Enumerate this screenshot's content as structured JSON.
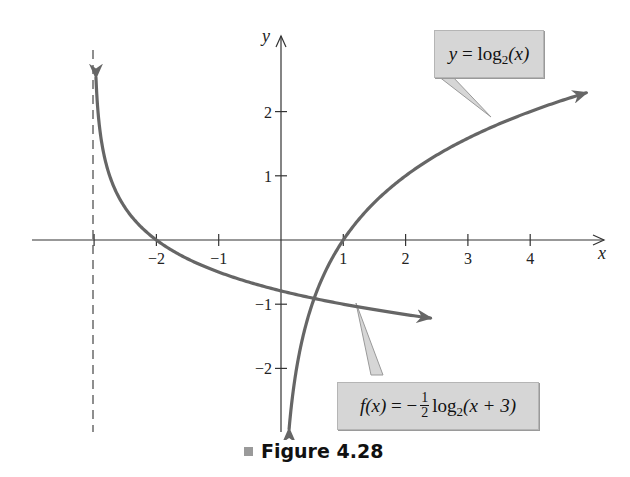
{
  "figure": {
    "caption": "Figure 4.28"
  },
  "labels": {
    "x_axis": "x",
    "y_axis": "y",
    "callout_log2": {
      "lhs": "y",
      "eq": " = log",
      "base": "2",
      "arg": "(x)"
    },
    "callout_f": {
      "lhs": "f(x)",
      "eq": " = −",
      "frac_num": "1",
      "frac_den": "2",
      "log": "log",
      "base": "2",
      "arg": "(x + 3)"
    }
  },
  "colors": {
    "curve": "#666666",
    "axis": "#333333",
    "callout_bg": "#d6d6d6"
  },
  "chart_data": {
    "type": "line",
    "title": "Figure 4.28",
    "xlabel": "x",
    "ylabel": "y",
    "xlim": [
      -3.9,
      5.2
    ],
    "ylim": [
      -3.0,
      3.3
    ],
    "grid": false,
    "x_ticks": [
      -3,
      -2,
      -1,
      1,
      2,
      3,
      4
    ],
    "x_tick_labels": [
      "",
      "−2",
      "−1",
      "1",
      "2",
      "3",
      "4"
    ],
    "y_ticks": [
      2,
      1,
      -1,
      -2
    ],
    "y_tick_labels": [
      "2",
      "1",
      "−1",
      "−2"
    ],
    "asymptote": {
      "type": "vertical",
      "x": -3,
      "style": "dashed"
    },
    "series": [
      {
        "name": "y = log2(x)",
        "formula": "log2(x)",
        "x_range": [
          0.13,
          4.9
        ],
        "points": [
          [
            0.13,
            -2.94
          ],
          [
            0.25,
            -2
          ],
          [
            0.5,
            -1
          ],
          [
            1,
            0
          ],
          [
            2,
            1
          ],
          [
            3,
            1.585
          ],
          [
            4,
            2
          ],
          [
            4.9,
            2.29
          ]
        ],
        "arrows": "both"
      },
      {
        "name": "f(x) = −1/2 log2(x + 3)",
        "formula": "-0.5*log2(x+3)",
        "x_range": [
          -2.97,
          2.4
        ],
        "points": [
          [
            -2.97,
            2.53
          ],
          [
            -2.75,
            1
          ],
          [
            -2.5,
            0.5
          ],
          [
            -2,
            0
          ],
          [
            -1,
            -0.5
          ],
          [
            0,
            -0.79
          ],
          [
            1,
            -1
          ],
          [
            2.4,
            -1.22
          ]
        ],
        "arrows": "both"
      }
    ],
    "annotations": [
      {
        "text": "y = log2(x)",
        "points_to": [
          2.4,
          1.5
        ]
      },
      {
        "text": "f(x) = −1/2 log2(x + 3)",
        "points_to": [
          1.5,
          -1.1
        ]
      }
    ]
  }
}
